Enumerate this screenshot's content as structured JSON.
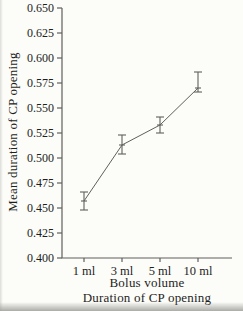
{
  "figure": {
    "bg_color": "#fcfcf9",
    "line_color": "#5f5f5d",
    "text_color": "#1e1e1c"
  },
  "chart_data": {
    "type": "line",
    "title": "",
    "xlabel": "Bolus volume",
    "xlabel_line2": "Duration of CP opening",
    "ylabel": "Mean duration of CP opening",
    "categories": [
      "1 ml",
      "3 ml",
      "5 ml",
      "10 ml"
    ],
    "series": [
      {
        "name": "Mean duration of CP opening",
        "values": [
          0.457,
          0.513,
          0.533,
          0.57
        ],
        "error_low": [
          0.448,
          0.504,
          0.525,
          0.566
        ],
        "error_high": [
          0.466,
          0.523,
          0.541,
          0.586
        ]
      }
    ],
    "ylim": [
      0.4,
      0.65
    ],
    "yticks": [
      0.65,
      0.625,
      0.6,
      0.575,
      0.55,
      0.525,
      0.5,
      0.475,
      0.45,
      0.425,
      0.4
    ],
    "ytick_decimals": 3,
    "grid": false,
    "legend_position": "none",
    "marker": "dash",
    "error_bars": true
  }
}
